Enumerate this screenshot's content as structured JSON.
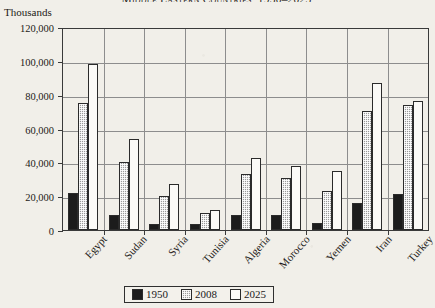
{
  "chart_data": {
    "type": "bar",
    "title": "Middle Eastern Countries, 1950–2025",
    "ylabel": "Thousands",
    "xlabel": "",
    "ylim": [
      0,
      120000
    ],
    "yticks": [
      0,
      20000,
      40000,
      60000,
      80000,
      100000,
      120000
    ],
    "ytick_labels": [
      "0",
      "20,000",
      "40,000",
      "60,000",
      "80,000",
      "100,000",
      "120,000"
    ],
    "grid": true,
    "legend_position": "bottom",
    "categories": [
      "Egypt",
      "Sudan",
      "Syria",
      "Tunisia",
      "Algeria",
      "Morocco",
      "Yemen",
      "Iran",
      "Turkey"
    ],
    "series": [
      {
        "name": "1950",
        "color": "#1c1c1c",
        "values": [
          22000,
          9000,
          3500,
          3500,
          8700,
          9000,
          4300,
          16000,
          21500
        ]
      },
      {
        "name": "2008",
        "color": "#9a9a9a",
        "values": [
          75000,
          40000,
          20000,
          10300,
          33000,
          31000,
          23000,
          70500,
          74000
        ]
      },
      {
        "name": "2025",
        "color": "#fbfaf7",
        "values": [
          98000,
          54000,
          27000,
          12000,
          42500,
          38000,
          35000,
          87000,
          76500
        ]
      }
    ]
  },
  "legend": {
    "items": [
      {
        "label": "1950"
      },
      {
        "label": "2008"
      },
      {
        "label": "2025"
      }
    ]
  }
}
